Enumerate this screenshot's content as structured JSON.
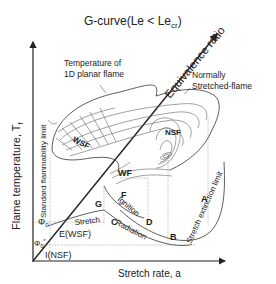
{
  "diagram": {
    "title_main": "G-curve(Le < Le",
    "title_sub": "cr",
    "title_close": ")",
    "y_axis_label": "Flame temperature, T",
    "y_axis_sub": "f",
    "x_axis_label": "Stretch rate,  a",
    "diagonal_axis_label": "Equivalence ratio",
    "annotations": {
      "planar_flame": [
        "Temperature of",
        "1D planar flame"
      ],
      "normally_stretched": [
        "Normally",
        "Stretched-flame"
      ],
      "standard_flammability_limit": "Standard flammability limit",
      "stretch_extinction_limit": "Stretch extinction limit"
    },
    "regions": {
      "wsf": "WSF",
      "nsf": "NSF",
      "wf": "WF"
    },
    "points": {
      "A": "A",
      "B": "B",
      "C": "C",
      "D": "D",
      "E": "E(WSF)",
      "F": "F",
      "G": "G",
      "I": "I(NSF)"
    },
    "curve_labels": {
      "stretch": "Stretch",
      "ignition": "Ignition",
      "radiation": "Radiation"
    },
    "phi_labels": {
      "phi0": "Φ",
      "phi0_sub": "0",
      "phi0_star": "Φ",
      "phi0_star_sub": "0",
      "phi0_star_sup": "*"
    }
  }
}
